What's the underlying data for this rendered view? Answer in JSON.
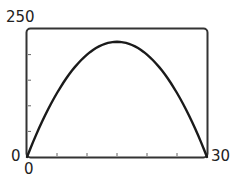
{
  "chart_data": {
    "type": "line",
    "title": "",
    "xlabel": "",
    "ylabel": "",
    "xlim": [
      0,
      30
    ],
    "ylim": [
      0,
      250
    ],
    "x_tick_labels": [
      "0",
      "30"
    ],
    "y_tick_labels": [
      "0",
      "250"
    ],
    "x_ticks": [
      0,
      5,
      10,
      15,
      20,
      25,
      30
    ],
    "y_ticks": [
      0,
      50,
      100,
      150,
      200,
      250
    ],
    "grid": false,
    "legend": null,
    "series": [
      {
        "name": "y = x(30 - x)",
        "x": [
          0,
          2.5,
          5,
          7.5,
          10,
          12.5,
          15,
          17.5,
          20,
          22.5,
          25,
          27.5,
          30
        ],
        "values": [
          0,
          68.75,
          125,
          168.75,
          200,
          218.75,
          225,
          218.75,
          200,
          168.75,
          125,
          68.75,
          0
        ]
      }
    ],
    "colors": {
      "curve": "#1a1a1a",
      "frame": "#333333"
    }
  },
  "labels": {
    "y_max": "250",
    "y_min": "0",
    "x_min": "0",
    "x_max": "30"
  }
}
